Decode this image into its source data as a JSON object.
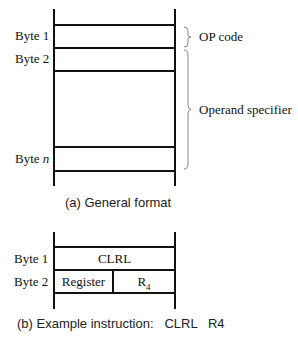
{
  "figure_a": {
    "rows": [
      {
        "label": "Byte 1"
      },
      {
        "label": "Byte 2"
      },
      {
        "label_prefix": "Byte ",
        "label_italic": "n"
      }
    ],
    "braces": [
      {
        "label": "OP code"
      },
      {
        "label": "Operand specifier"
      }
    ],
    "caption": "(a) General format"
  },
  "figure_b": {
    "rows": [
      {
        "label": "Byte 1",
        "cells": [
          "CLRL"
        ]
      },
      {
        "label": "Byte 2",
        "cells": [
          "Register",
          "R",
          "4"
        ]
      }
    ],
    "caption": "(b) Example instruction:   CLRL   R4"
  }
}
